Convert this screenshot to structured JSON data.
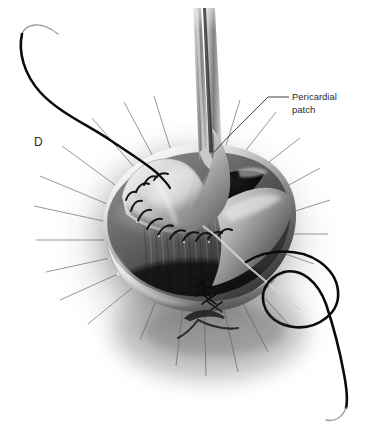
{
  "figure": {
    "panel_letter": "D",
    "domain": "medical-surgical-illustration",
    "style": "grayscale airbrush rendering on white background",
    "background_color": "#ffffff",
    "ink_color": "#2b2b2b",
    "suture_thread_color": "#111111",
    "cavity_color": "#0b0b0b"
  },
  "annotations": [
    {
      "name": "pericardial-patch-label",
      "line1": "Pericardial",
      "line2": "patch",
      "text_x": 292,
      "text_y": 100,
      "leader": "M 289 97 L 268 97 L 232 133 L 212 154"
    }
  ],
  "second_leader": {
    "name": "cavity-leader-line",
    "path": "M 300 310 L 250 268 L 216 236 L 203 226"
  },
  "anatomy": {
    "structure": "cardiac annulus with pericardial patch closure",
    "patch_label": "pericardial patch held in forceps",
    "cavity_label": "open chamber cavity",
    "rim_label": "annular rim"
  },
  "instruments": {
    "forceps_label": "forceps holding patch",
    "forceps_left_x": 196,
    "forceps_right_x": 214,
    "forceps_top_y": 10
  },
  "sutures": {
    "patch_suture_count": 13,
    "patch_suture_label": "interrupted suture line along patch edge",
    "stay_suture_count": 22,
    "stay_suture_label": "radiating stay sutures",
    "knot_cluster_label": "knotted suture cluster",
    "upper_thread_label": "suture thread with needle upper left",
    "lower_thread_label": "suture thread loop with needle lower right"
  }
}
